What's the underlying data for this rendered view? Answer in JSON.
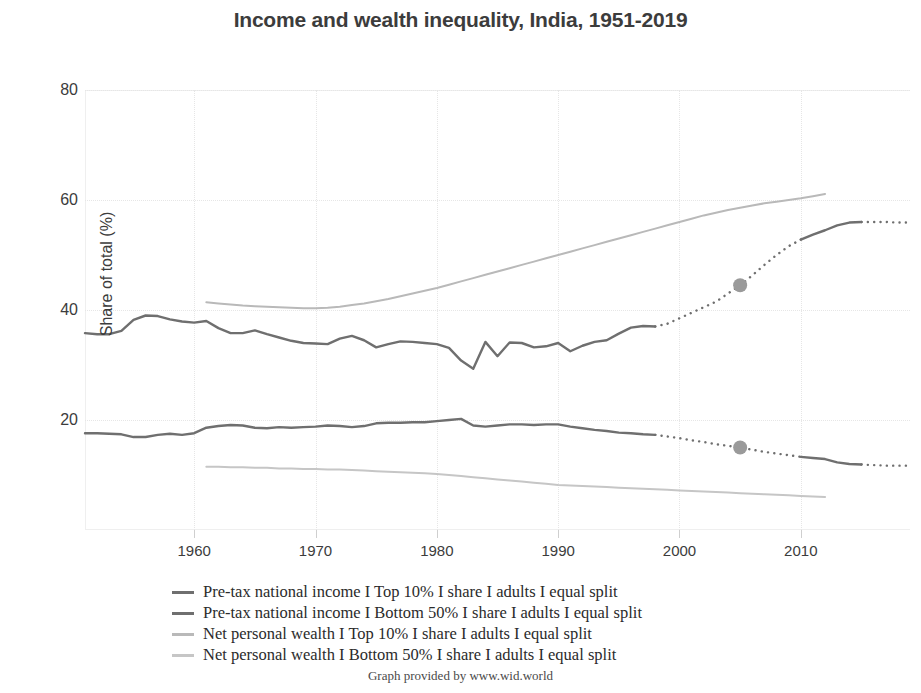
{
  "header": {
    "title": "Income and wealth inequality, India, 1951-2019"
  },
  "credit": "Graph provided by www.wid.world",
  "legend": {
    "items": [
      {
        "label": "Pre-tax national income I Top 10% I share I adults I equal split",
        "color": "#6f6f6f"
      },
      {
        "label": "Pre-tax national income I Bottom 50% I share I adults I equal split",
        "color": "#6f6f6f"
      },
      {
        "label": "Net personal wealth I Top 10% I share I adults I equal split",
        "color": "#b9b9b9"
      },
      {
        "label": "Net personal wealth I Bottom 50% I share I adults I equal split",
        "color": "#c6c6c6"
      }
    ]
  },
  "chart_data": {
    "type": "line",
    "title": "Income and wealth inequality, India, 1951-2019",
    "xlabel": "",
    "ylabel": "Share of total (%)",
    "xlim": [
      1951,
      2019
    ],
    "ylim": [
      0,
      80
    ],
    "grid": true,
    "legend_position": "below",
    "x_ticks": [
      1960,
      1970,
      1980,
      1990,
      2000,
      2010
    ],
    "y_ticks": [
      20,
      40,
      60,
      80
    ],
    "markers": [
      {
        "series": "Pre-tax national income I Top 10%",
        "x": 2005,
        "y": 44.5,
        "color": "#9a9a9a"
      },
      {
        "series": "Pre-tax national income I Bottom 50%",
        "x": 2005,
        "y": 15.0,
        "color": "#9a9a9a"
      }
    ],
    "series": [
      {
        "name": "Pre-tax national income I Top 10% I share I adults I equal split",
        "color": "#6f6f6f",
        "width": 2.4,
        "solid_until": 1998,
        "dotted_from": 1998,
        "solid_resume": [
          2010,
          2014
        ],
        "x": [
          1951,
          1952,
          1953,
          1954,
          1955,
          1956,
          1957,
          1958,
          1959,
          1960,
          1961,
          1962,
          1963,
          1964,
          1965,
          1966,
          1967,
          1968,
          1969,
          1970,
          1971,
          1972,
          1973,
          1974,
          1975,
          1976,
          1977,
          1978,
          1979,
          1980,
          1981,
          1982,
          1983,
          1984,
          1985,
          1986,
          1987,
          1988,
          1989,
          1990,
          1991,
          1992,
          1993,
          1994,
          1995,
          1996,
          1997,
          1998,
          1999,
          2000,
          2001,
          2002,
          2003,
          2004,
          2005,
          2006,
          2007,
          2008,
          2009,
          2010,
          2011,
          2012,
          2013,
          2014,
          2015,
          2016,
          2017,
          2018,
          2019
        ],
        "y": [
          35.8,
          35.6,
          35.6,
          36.2,
          38.2,
          39.0,
          38.9,
          38.3,
          37.9,
          37.7,
          38.0,
          36.7,
          35.8,
          35.8,
          36.3,
          35.6,
          35.0,
          34.4,
          34.0,
          33.9,
          33.8,
          34.8,
          35.3,
          34.5,
          33.2,
          33.8,
          34.3,
          34.2,
          34.0,
          33.8,
          33.1,
          30.8,
          29.3,
          34.2,
          31.6,
          34.1,
          34.0,
          33.2,
          33.4,
          34.0,
          32.5,
          33.5,
          34.2,
          34.5,
          35.7,
          36.8,
          37.1,
          37.0,
          37.5,
          38.5,
          39.5,
          40.5,
          41.5,
          43.0,
          44.5,
          46.3,
          48.2,
          50.0,
          51.6,
          52.8,
          53.7,
          54.5,
          55.4,
          55.9,
          56.0,
          56.0,
          56.0,
          55.9,
          55.9
        ]
      },
      {
        "name": "Pre-tax national income I Bottom 50% I share I adults I equal split",
        "color": "#6f6f6f",
        "width": 2.4,
        "solid_until": 1998,
        "dotted_from": 1998,
        "solid_resume": [
          2010,
          2014
        ],
        "x": [
          1951,
          1952,
          1953,
          1954,
          1955,
          1956,
          1957,
          1958,
          1959,
          1960,
          1961,
          1962,
          1963,
          1964,
          1965,
          1966,
          1967,
          1968,
          1969,
          1970,
          1971,
          1972,
          1973,
          1974,
          1975,
          1976,
          1977,
          1978,
          1979,
          1980,
          1981,
          1982,
          1983,
          1984,
          1985,
          1986,
          1987,
          1988,
          1989,
          1990,
          1991,
          1992,
          1993,
          1994,
          1995,
          1996,
          1997,
          1998,
          1999,
          2000,
          2001,
          2002,
          2003,
          2004,
          2005,
          2006,
          2007,
          2008,
          2009,
          2010,
          2011,
          2012,
          2013,
          2014,
          2015,
          2016,
          2017,
          2018,
          2019
        ],
        "y": [
          17.6,
          17.6,
          17.5,
          17.4,
          16.9,
          16.9,
          17.3,
          17.5,
          17.3,
          17.6,
          18.6,
          18.9,
          19.1,
          19.0,
          18.6,
          18.5,
          18.7,
          18.6,
          18.7,
          18.8,
          19.0,
          18.9,
          18.7,
          18.9,
          19.4,
          19.5,
          19.5,
          19.6,
          19.6,
          19.8,
          20.0,
          20.2,
          19.0,
          18.8,
          19.0,
          19.2,
          19.2,
          19.1,
          19.2,
          19.2,
          18.8,
          18.5,
          18.2,
          18.0,
          17.7,
          17.6,
          17.4,
          17.3,
          17.0,
          16.7,
          16.3,
          16.0,
          15.6,
          15.3,
          15.0,
          14.6,
          14.2,
          13.9,
          13.6,
          13.3,
          13.1,
          12.9,
          12.3,
          12.0,
          11.9,
          11.8,
          11.7,
          11.7,
          11.7
        ]
      },
      {
        "name": "Net personal wealth I Top 10% I share I adults I equal split",
        "color": "#b9b9b9",
        "width": 2.0,
        "solid_until": 2012,
        "x": [
          1961,
          1962,
          1963,
          1964,
          1965,
          1966,
          1967,
          1968,
          1969,
          1970,
          1971,
          1972,
          1973,
          1974,
          1975,
          1976,
          1977,
          1978,
          1979,
          1980,
          1981,
          1982,
          1983,
          1984,
          1985,
          1986,
          1987,
          1988,
          1989,
          1990,
          1991,
          1992,
          1993,
          1994,
          1995,
          1996,
          1997,
          1998,
          1999,
          2000,
          2001,
          2002,
          2003,
          2004,
          2005,
          2006,
          2007,
          2008,
          2009,
          2010,
          2011,
          2012
        ],
        "y": [
          41.4,
          41.2,
          41.0,
          40.8,
          40.7,
          40.6,
          40.5,
          40.4,
          40.3,
          40.3,
          40.4,
          40.6,
          40.9,
          41.2,
          41.6,
          42.0,
          42.5,
          43.0,
          43.5,
          44.0,
          44.6,
          45.2,
          45.8,
          46.4,
          47.0,
          47.6,
          48.2,
          48.8,
          49.4,
          50.0,
          50.6,
          51.2,
          51.8,
          52.4,
          53.0,
          53.6,
          54.2,
          54.8,
          55.4,
          56.0,
          56.6,
          57.2,
          57.7,
          58.2,
          58.6,
          59.0,
          59.4,
          59.7,
          60.0,
          60.3,
          60.7,
          61.1
        ]
      },
      {
        "name": "Net personal wealth I Bottom 50% I share I adults I equal split",
        "color": "#c6c6c6",
        "width": 2.0,
        "solid_until": 2012,
        "x": [
          1961,
          1962,
          1963,
          1964,
          1965,
          1966,
          1967,
          1968,
          1969,
          1970,
          1971,
          1972,
          1973,
          1974,
          1975,
          1976,
          1977,
          1978,
          1979,
          1980,
          1981,
          1982,
          1983,
          1984,
          1985,
          1986,
          1987,
          1988,
          1989,
          1990,
          1991,
          1992,
          1993,
          1994,
          1995,
          1996,
          1997,
          1998,
          1999,
          2000,
          2001,
          2002,
          2003,
          2004,
          2005,
          2006,
          2007,
          2008,
          2009,
          2010,
          2011,
          2012
        ],
        "y": [
          11.5,
          11.5,
          11.4,
          11.4,
          11.3,
          11.3,
          11.2,
          11.2,
          11.1,
          11.1,
          11.0,
          11.0,
          10.9,
          10.8,
          10.7,
          10.6,
          10.5,
          10.4,
          10.3,
          10.2,
          10.0,
          9.8,
          9.6,
          9.4,
          9.2,
          9.0,
          8.8,
          8.6,
          8.4,
          8.2,
          8.1,
          8.0,
          7.9,
          7.8,
          7.7,
          7.6,
          7.5,
          7.4,
          7.3,
          7.2,
          7.1,
          7.0,
          6.9,
          6.8,
          6.7,
          6.6,
          6.5,
          6.4,
          6.3,
          6.2,
          6.1,
          6.0
        ]
      }
    ]
  }
}
